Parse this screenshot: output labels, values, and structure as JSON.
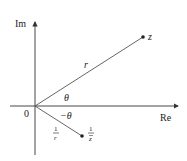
{
  "diagram": {
    "axes": {
      "real_label": "Re",
      "imag_label": "Im",
      "origin_label": "0"
    },
    "points": {
      "z": {
        "label": "z"
      },
      "inverse": {
        "label_num": "1",
        "label_den": "z",
        "label_den_bar": true
      }
    },
    "labels": {
      "modulus": "r",
      "angle": "θ",
      "neg_angle": "−θ",
      "inv_modulus_num": "1",
      "inv_modulus_den": "r"
    },
    "colors": {
      "axis": "#333333",
      "ray": "#555555",
      "point": "#222222"
    }
  }
}
